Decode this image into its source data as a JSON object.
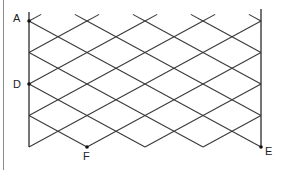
{
  "diagram": {
    "type": "crossed diagonal lattice (trellis) between two parallel vertical lines",
    "left_vertical_line": {
      "x": 29,
      "y_top": 12,
      "y_bottom": 147
    },
    "right_vertical_line": {
      "x": 261,
      "y_top": 9,
      "y_bottom": 147
    },
    "grid": {
      "x0": 29,
      "dx": 29,
      "cols": 8,
      "y0": 21,
      "dy": 15.75,
      "rows": 8
    },
    "labels": [
      {
        "id": "A",
        "text": "A",
        "point": [
          29,
          21
        ],
        "label_pos": [
          13,
          22
        ]
      },
      {
        "id": "D",
        "text": "D",
        "point": [
          29,
          84
        ],
        "label_pos": [
          13,
          88
        ]
      },
      {
        "id": "F",
        "text": "F",
        "point": [
          87,
          147
        ],
        "label_pos": [
          83,
          160
        ]
      },
      {
        "id": "E",
        "text": "E",
        "point": [
          261,
          147
        ],
        "label_pos": [
          265,
          155
        ]
      }
    ],
    "colors": {
      "lines": "#3a3a3a",
      "frame": "#8a8a8a",
      "points": "#111111"
    }
  }
}
